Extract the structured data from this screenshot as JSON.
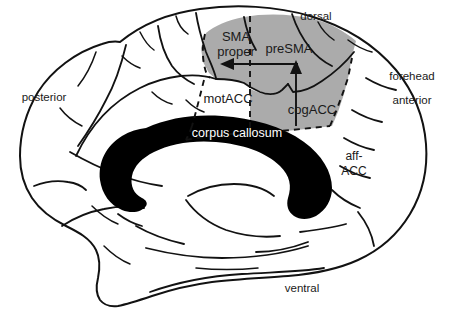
{
  "figure": {
    "colors": {
      "shade_gray": "#ababab",
      "outline_black": "#121212",
      "corpus_callosum_fill": "#000000",
      "label_on_dark": "#ffffff",
      "background": "#ffffff"
    }
  },
  "regions": {
    "sma_proper_line1": "SMA",
    "sma_proper_line2": "proper",
    "presma": "preSMA",
    "motacc": "motACC",
    "cogacc": "cogACC",
    "affacc_line1": "aff-",
    "affacc_line2": "ACC",
    "corpus_callosum": "corpus callosum"
  },
  "orientation": {
    "dorsal": "dorsal",
    "ventral": "ventral",
    "anterior": "anterior",
    "posterior": "posterior",
    "forehead": "forehead"
  },
  "annotations": {
    "arrow_horizontal": "leftward arrow from preSMA to SMA proper",
    "arrow_vertical": "upward arrow from cogACC to preSMA"
  }
}
